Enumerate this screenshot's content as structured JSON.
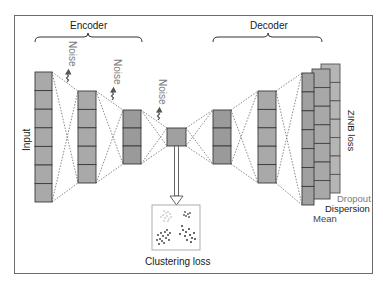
{
  "labels": {
    "encoder": "Encoder",
    "decoder": "Decoder",
    "input": "Input",
    "noise": "Noise",
    "zinb_loss": "ZINB loss",
    "clustering_loss": "Clustering loss",
    "mean": "Mean",
    "dispersion": "Dispersion",
    "dropout": "Dropout"
  },
  "layers": {
    "encoder": [
      {
        "name": "input",
        "cells": 7
      },
      {
        "name": "hidden-1",
        "cells": 5
      },
      {
        "name": "hidden-2",
        "cells": 3
      }
    ],
    "bottleneck": {
      "cells": 1
    },
    "decoder": [
      {
        "name": "hidden-3",
        "cells": 3
      },
      {
        "name": "hidden-4",
        "cells": 5
      }
    ],
    "outputs": [
      "Mean",
      "Dispersion",
      "Dropout"
    ]
  },
  "noise_count": 3,
  "colors": {
    "cell_fill": "#a8a8a8",
    "cell_stroke": "#3a3a3a",
    "dashed_line": "#555555",
    "frame": "#6b6b6b",
    "gray_text": "#7a7a7a"
  }
}
